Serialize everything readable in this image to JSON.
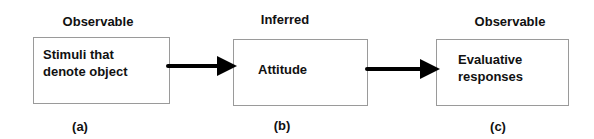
{
  "nodes": [
    {
      "id": "a",
      "top_label": "Observable",
      "lines": [
        "Stimuli that",
        "denote object"
      ],
      "caption": "(a)"
    },
    {
      "id": "b",
      "top_label": "Inferred",
      "lines": [
        "Attitude"
      ],
      "caption": "(b)"
    },
    {
      "id": "c",
      "top_label": "Observable",
      "lines": [
        "Evaluative",
        "responses"
      ],
      "caption": "(c)"
    }
  ],
  "edges": [
    {
      "from": "a",
      "to": "b"
    },
    {
      "from": "b",
      "to": "c"
    }
  ],
  "colors": {
    "border": "#9a9a9a",
    "arrow": "#000000",
    "text": "#111111"
  }
}
